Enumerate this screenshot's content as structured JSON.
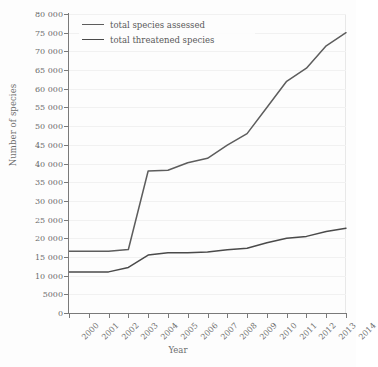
{
  "chart_data": {
    "type": "line",
    "title": "",
    "xlabel": "Year",
    "ylabel": "Number of species",
    "xlim": [
      2000,
      2014
    ],
    "ylim": [
      0,
      80000
    ],
    "grid": true,
    "legend_position": "upper left",
    "categories": [
      2000,
      2001,
      2002,
      2003,
      2004,
      2005,
      2006,
      2007,
      2008,
      2009,
      2010,
      2011,
      2012,
      2013,
      2014
    ],
    "x_tick_labels": [
      "2000",
      "2001",
      "2002",
      "2003",
      "2004",
      "2005",
      "2006",
      "2007",
      "2008",
      "2009",
      "2010",
      "2011",
      "2012",
      "2013",
      "2014"
    ],
    "y_tick_labels": [
      "0",
      "5000",
      "10 000",
      "15 000",
      "20 000",
      "25 000",
      "30 000",
      "35 000",
      "40 000",
      "45 000",
      "50 000",
      "55 000",
      "60 000",
      "65 000",
      "70 000",
      "75 000",
      "80 000"
    ],
    "y_ticks": [
      0,
      5000,
      10000,
      15000,
      20000,
      25000,
      30000,
      35000,
      40000,
      45000,
      50000,
      55000,
      60000,
      65000,
      70000,
      75000,
      80000
    ],
    "series": [
      {
        "name": "total species assessed",
        "color": "#5d5d5d",
        "values": [
          16500,
          16500,
          16500,
          17000,
          38000,
          38200,
          40200,
          41400,
          44900,
          48000,
          55000,
          62000,
          65500,
          71500,
          75000
        ]
      },
      {
        "name": "total threatened species",
        "color": "#4a4a4a",
        "values": [
          11000,
          11000,
          11000,
          12200,
          15500,
          16100,
          16100,
          16300,
          16900,
          17300,
          18800,
          20000,
          20500,
          21800,
          22700
        ]
      }
    ]
  },
  "axes": {
    "x_title": "Year",
    "y_title": "Number of species"
  },
  "legend": {
    "items": [
      {
        "label": "total species assessed"
      },
      {
        "label": "total threatened species"
      }
    ]
  }
}
